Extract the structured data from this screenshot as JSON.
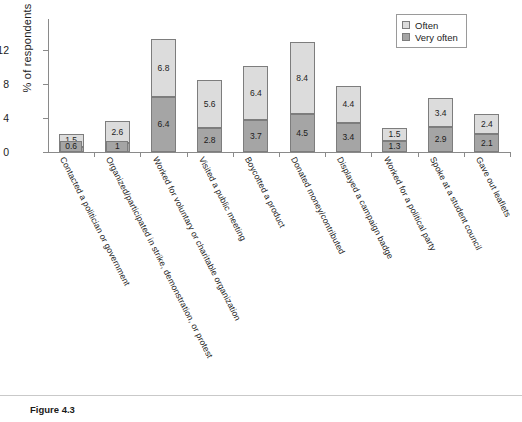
{
  "figure": {
    "caption": "Figure 4.3"
  },
  "legend": {
    "position": "top-right",
    "items": [
      {
        "label": "Often",
        "color": "#dcdcdc",
        "swatch_name": "legend-swatch-often"
      },
      {
        "label": "Very often",
        "color": "#a5a5a5",
        "swatch_name": "legend-swatch-very-often"
      }
    ]
  },
  "chart_data": {
    "type": "bar",
    "stacked": true,
    "title": "",
    "xlabel": "",
    "ylabel": "% of respondents",
    "ylim": [
      0,
      15.6
    ],
    "yticks": [
      0,
      4,
      8,
      12
    ],
    "grid": false,
    "categories": [
      "Contacted a politician or government",
      "Organized/participated in strike, demonstration, or protest",
      "Worked for voluntary or charitable organization",
      "Visited a public meeting",
      "Boycotted a product",
      "Donated money/contributed",
      "Displayed a campaign badge",
      "Worked for a political party",
      "Spoke at a student council",
      "Gave out leaflets"
    ],
    "series": [
      {
        "name": "Very often",
        "color": "#a5a5a5",
        "values": [
          0.6,
          1,
          6.4,
          2.8,
          3.7,
          4.5,
          3.4,
          1.3,
          2.9,
          2.1
        ]
      },
      {
        "name": "Often",
        "color": "#dcdcdc",
        "values": [
          1.5,
          2.6,
          6.8,
          5.6,
          6.4,
          8.4,
          4.4,
          1.5,
          3.4,
          2.4
        ]
      }
    ],
    "totals": [
      2.1,
      3.6,
      13.2,
      8.4,
      10.1,
      12.9,
      7.8,
      2.8,
      6.3,
      4.5
    ]
  }
}
